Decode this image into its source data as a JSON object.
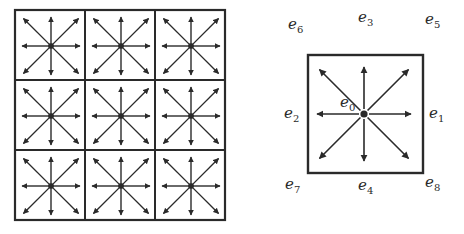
{
  "diagram": {
    "type": "lattice-velocity-set",
    "colors": {
      "stroke": "#2a2a2a",
      "background": "#ffffff"
    },
    "grid": {
      "rows": 3,
      "cols": 3,
      "arrows_per_node": 8,
      "has_center_node": true
    },
    "detail_cell": {
      "labels": [
        {
          "id": "e0",
          "base": "e",
          "sub": "0",
          "position": "center"
        },
        {
          "id": "e1",
          "base": "e",
          "sub": "1",
          "position": "right"
        },
        {
          "id": "e2",
          "base": "e",
          "sub": "2",
          "position": "left"
        },
        {
          "id": "e3",
          "base": "e",
          "sub": "3",
          "position": "top"
        },
        {
          "id": "e4",
          "base": "e",
          "sub": "4",
          "position": "bottom"
        },
        {
          "id": "e5",
          "base": "e",
          "sub": "5",
          "position": "top-right"
        },
        {
          "id": "e6",
          "base": "e",
          "sub": "6",
          "position": "top-left"
        },
        {
          "id": "e7",
          "base": "e",
          "sub": "7",
          "position": "bottom-left"
        },
        {
          "id": "e8",
          "base": "e",
          "sub": "8",
          "position": "bottom-right"
        }
      ]
    }
  }
}
